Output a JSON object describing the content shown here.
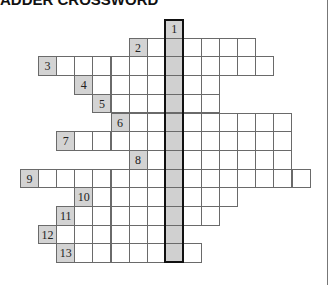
{
  "title": "ADDER CROSSWORD",
  "colors": {
    "numbered_cell_fill": "#d3d3d3",
    "key_column_fill": "#d0d0d0",
    "cell_border": "#6a6a6a",
    "key_column_border": "#111111"
  },
  "grid": {
    "origin_x": 20,
    "origin_y": 19,
    "cell_w": 18.1,
    "cell_h": 18.7,
    "key_column": 8,
    "rows": [
      {
        "number": "1",
        "start_col": 8,
        "length": 1
      },
      {
        "number": "2",
        "start_col": 6,
        "length": 7
      },
      {
        "number": "3",
        "start_col": 1,
        "length": 13
      },
      {
        "number": "4",
        "start_col": 3,
        "length": 8
      },
      {
        "number": "5",
        "start_col": 4,
        "length": 7
      },
      {
        "number": "6",
        "start_col": 5,
        "length": 10
      },
      {
        "number": "7",
        "start_col": 2,
        "length": 13
      },
      {
        "number": "8",
        "start_col": 6,
        "length": 9
      },
      {
        "number": "9",
        "start_col": 0,
        "length": 16
      },
      {
        "number": "10",
        "start_col": 3,
        "length": 9
      },
      {
        "number": "11",
        "start_col": 2,
        "length": 9
      },
      {
        "number": "12",
        "start_col": 1,
        "length": 8
      },
      {
        "number": "13",
        "start_col": 2,
        "length": 8
      }
    ]
  }
}
